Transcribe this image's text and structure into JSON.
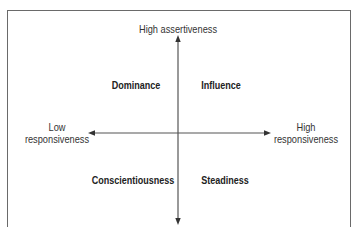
{
  "diagram": {
    "type": "quadrant",
    "axes": {
      "vertical": {
        "top_label": "High assertiveness"
      },
      "horizontal": {
        "left_label_line1": "Low",
        "left_label_line2": "responsiveness",
        "right_label_line1": "High",
        "right_label_line2": "responsiveness"
      }
    },
    "quadrants": {
      "top_left": "Dominance",
      "top_right": "Influence",
      "bottom_left": "Conscientiousness",
      "bottom_right": "Steadiness"
    },
    "colors": {
      "line": "#555555",
      "frame": "#6a6a6a",
      "text": "#2a2a2a",
      "background": "#ffffff"
    }
  }
}
